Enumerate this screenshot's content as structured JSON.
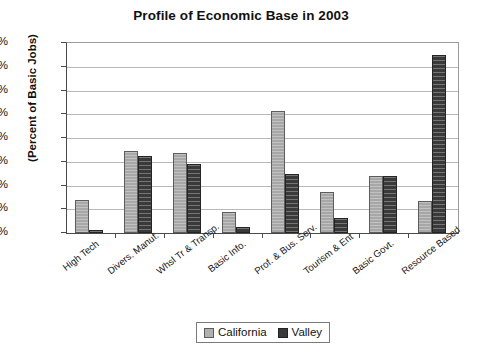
{
  "chart_data": {
    "type": "bar",
    "title": "Profile of Economic Base in 2003",
    "xlabel": "",
    "ylabel": "(Percent of Basic Jobs)",
    "ylim": [
      0,
      40
    ],
    "ytick_step": 5,
    "ytick_labels": [
      "40%",
      "35%",
      "30%",
      "25%",
      "20%",
      "15%",
      "10%",
      "5%",
      "0%"
    ],
    "grid": true,
    "legend_position": "bottom-center",
    "categories": [
      "High Tech",
      "Divers. Manuf.",
      "Whsl Tr & Transp.",
      "Basic Info.",
      "Prof. & Bus. Serv.",
      "Tourism & Ent",
      "Basic Govt.",
      "Resource Based"
    ],
    "series": [
      {
        "name": "California",
        "color": "#b0b0b0",
        "values": [
          7.0,
          17.3,
          16.8,
          4.5,
          25.7,
          8.7,
          11.9,
          6.8
        ]
      },
      {
        "name": "Valley",
        "color": "#3a3a3a",
        "values": [
          0.7,
          16.2,
          14.5,
          1.3,
          12.5,
          3.2,
          12.1,
          37.5
        ]
      }
    ]
  }
}
